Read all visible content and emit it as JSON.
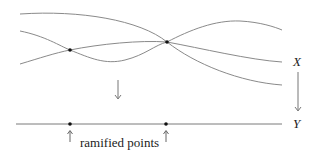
{
  "diagram": {
    "cover_label": "X",
    "base_label": "Y",
    "caption": "ramified points",
    "map_arrow_icon": "down-arrow-icon",
    "pointer_icon": "up-arrow-icon",
    "colors": {
      "curve": "#8a8a8a",
      "line": "#7a7a7a",
      "dot": "#111111",
      "text": "#222222"
    },
    "ramification_points_x": [
      70,
      166
    ],
    "sheets": 3
  }
}
